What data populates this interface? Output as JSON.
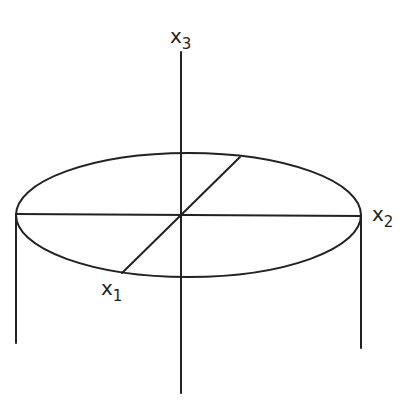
{
  "diagram": {
    "colors": {
      "stroke": "#222222",
      "background": "#ffffff"
    },
    "labels": {
      "x3": {
        "base": "x",
        "sub": "3"
      },
      "x2": {
        "base": "x",
        "sub": "2"
      },
      "x1": {
        "base": "x",
        "sub": "1"
      }
    },
    "geometry": {
      "center": [
        181,
        215
      ],
      "ellipse": {
        "rx": 172,
        "ry": 62
      },
      "axis_x3": {
        "from": [
          181,
          52
        ],
        "to": [
          181,
          393
        ]
      },
      "axis_x2": {
        "from": [
          16,
          214
        ],
        "to": [
          361,
          216
        ]
      },
      "axis_x1": {
        "from": [
          122,
          273
        ],
        "to": [
          240,
          157
        ]
      },
      "left_wall": {
        "from": [
          16,
          214
        ],
        "to": [
          16,
          343
        ]
      },
      "right_wall": {
        "from": [
          361,
          216
        ],
        "to": [
          361,
          348
        ]
      }
    }
  }
}
